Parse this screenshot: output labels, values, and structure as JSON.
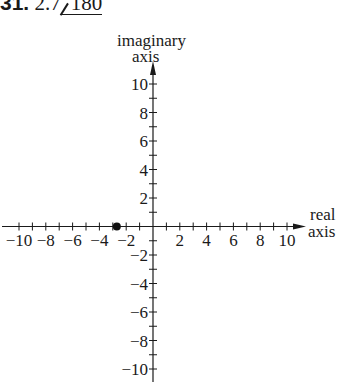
{
  "problem": {
    "number": "31.",
    "magnitude": "2.7",
    "angle": "180"
  },
  "chart_data": {
    "type": "scatter",
    "title": "",
    "xlabel": "real axis",
    "ylabel": "imaginary axis",
    "xlabel_lines": [
      "real",
      "axis"
    ],
    "ylabel_lines": [
      "imaginary",
      "axis"
    ],
    "xlim": [
      -10,
      10
    ],
    "ylim": [
      -10,
      10
    ],
    "x_ticks": [
      -10,
      -8,
      -6,
      -4,
      -2,
      2,
      4,
      6,
      8,
      10
    ],
    "y_ticks": [
      10,
      8,
      6,
      4,
      2,
      -2,
      -4,
      -6,
      -8,
      -10
    ],
    "x_tick_labels": [
      "−10",
      "−8",
      "−6",
      "−4",
      "−2",
      "2",
      "4",
      "6",
      "8",
      "10"
    ],
    "y_tick_labels": [
      "10",
      "8",
      "6",
      "4",
      "2",
      "−2",
      "−4",
      "−6",
      "−8",
      "−10"
    ],
    "minor_tick_step": 1,
    "grid": false,
    "points": [
      {
        "x": -2.7,
        "y": 0
      }
    ]
  }
}
